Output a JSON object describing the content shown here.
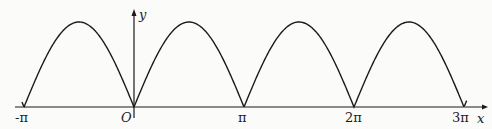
{
  "chart_data": {
    "type": "line",
    "title": "",
    "function": "y = |sin x|",
    "xlabel": "x",
    "ylabel": "y",
    "origin_label": "O",
    "x_ticks": [
      "-π",
      "O",
      "π",
      "2π",
      "3π"
    ],
    "x_tick_values": [
      -3.1416,
      0,
      3.1416,
      6.2832,
      9.4248
    ],
    "xlim": [
      -3.3,
      9.6
    ],
    "ylim": [
      0,
      1
    ],
    "zeros": [
      -3.1416,
      0,
      3.1416,
      6.2832,
      9.4248
    ],
    "peaks": [
      {
        "x": -1.5708,
        "y": 1
      },
      {
        "x": 1.5708,
        "y": 1
      },
      {
        "x": 4.7124,
        "y": 1
      },
      {
        "x": 7.854,
        "y": 1
      }
    ],
    "grid": false,
    "legend": null
  },
  "labels": {
    "neg_pi": "-π",
    "origin": "O",
    "pi": "π",
    "two_pi": "2π",
    "three_pi": "3π",
    "x_axis": "x",
    "y_axis": "y"
  },
  "colors": {
    "stroke": "#1a1a1a",
    "background": "#fbfbfa"
  }
}
